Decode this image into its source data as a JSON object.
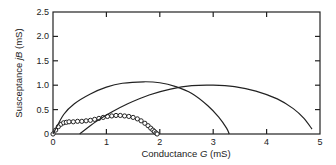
{
  "chart_data": {
    "type": "line",
    "title": "",
    "xlabel": "Conductance G (mS)",
    "ylabel": "Susceptance jB (mS)",
    "xlabel_parts": [
      "Conductance ",
      "G",
      " (mS)"
    ],
    "ylabel_parts": [
      "Susceptance ",
      "jB",
      " (mS)"
    ],
    "xlim": [
      0,
      5
    ],
    "ylim": [
      0,
      2.5
    ],
    "xticks": [
      "0",
      "1",
      "2",
      "3",
      "4",
      "5"
    ],
    "yticks": [
      "0",
      "0.5",
      "1.0",
      "1.5",
      "2.0",
      "2.5"
    ],
    "grid": false,
    "legend": "none",
    "series": [
      {
        "name": "measured (circles)",
        "style": "circle-markers",
        "x": [
          0.0,
          0.05,
          0.1,
          0.15,
          0.2,
          0.25,
          0.3,
          0.38,
          0.46,
          0.54,
          0.62,
          0.7,
          0.78,
          0.86,
          0.94,
          1.02,
          1.1,
          1.18,
          1.26,
          1.34,
          1.42,
          1.5,
          1.58,
          1.65,
          1.72,
          1.78,
          1.83,
          1.87,
          1.9,
          1.93,
          1.95
        ],
        "y": [
          0.0,
          0.08,
          0.15,
          0.2,
          0.23,
          0.24,
          0.25,
          0.25,
          0.26,
          0.26,
          0.27,
          0.28,
          0.3,
          0.32,
          0.34,
          0.36,
          0.37,
          0.38,
          0.38,
          0.37,
          0.36,
          0.34,
          0.31,
          0.27,
          0.22,
          0.17,
          0.12,
          0.08,
          0.05,
          0.02,
          0.0
        ]
      },
      {
        "name": "arc A",
        "style": "solid-line",
        "x": [
          0.0,
          0.2,
          0.4,
          0.7,
          1.0,
          1.3,
          1.7,
          2.0,
          2.3,
          2.6,
          2.9,
          3.1,
          3.25,
          3.3
        ],
        "y": [
          0.0,
          0.4,
          0.62,
          0.82,
          0.96,
          1.04,
          1.07,
          1.05,
          0.97,
          0.83,
          0.58,
          0.35,
          0.12,
          0.0
        ]
      },
      {
        "name": "arc B",
        "style": "solid-line",
        "x": [
          0.5,
          0.8,
          1.1,
          1.4,
          1.8,
          2.2,
          2.6,
          3.0,
          3.4,
          3.8,
          4.2,
          4.5,
          4.7,
          4.85
        ],
        "y": [
          0.0,
          0.25,
          0.45,
          0.62,
          0.8,
          0.92,
          0.99,
          1.0,
          0.97,
          0.88,
          0.72,
          0.52,
          0.32,
          0.1
        ]
      }
    ]
  }
}
